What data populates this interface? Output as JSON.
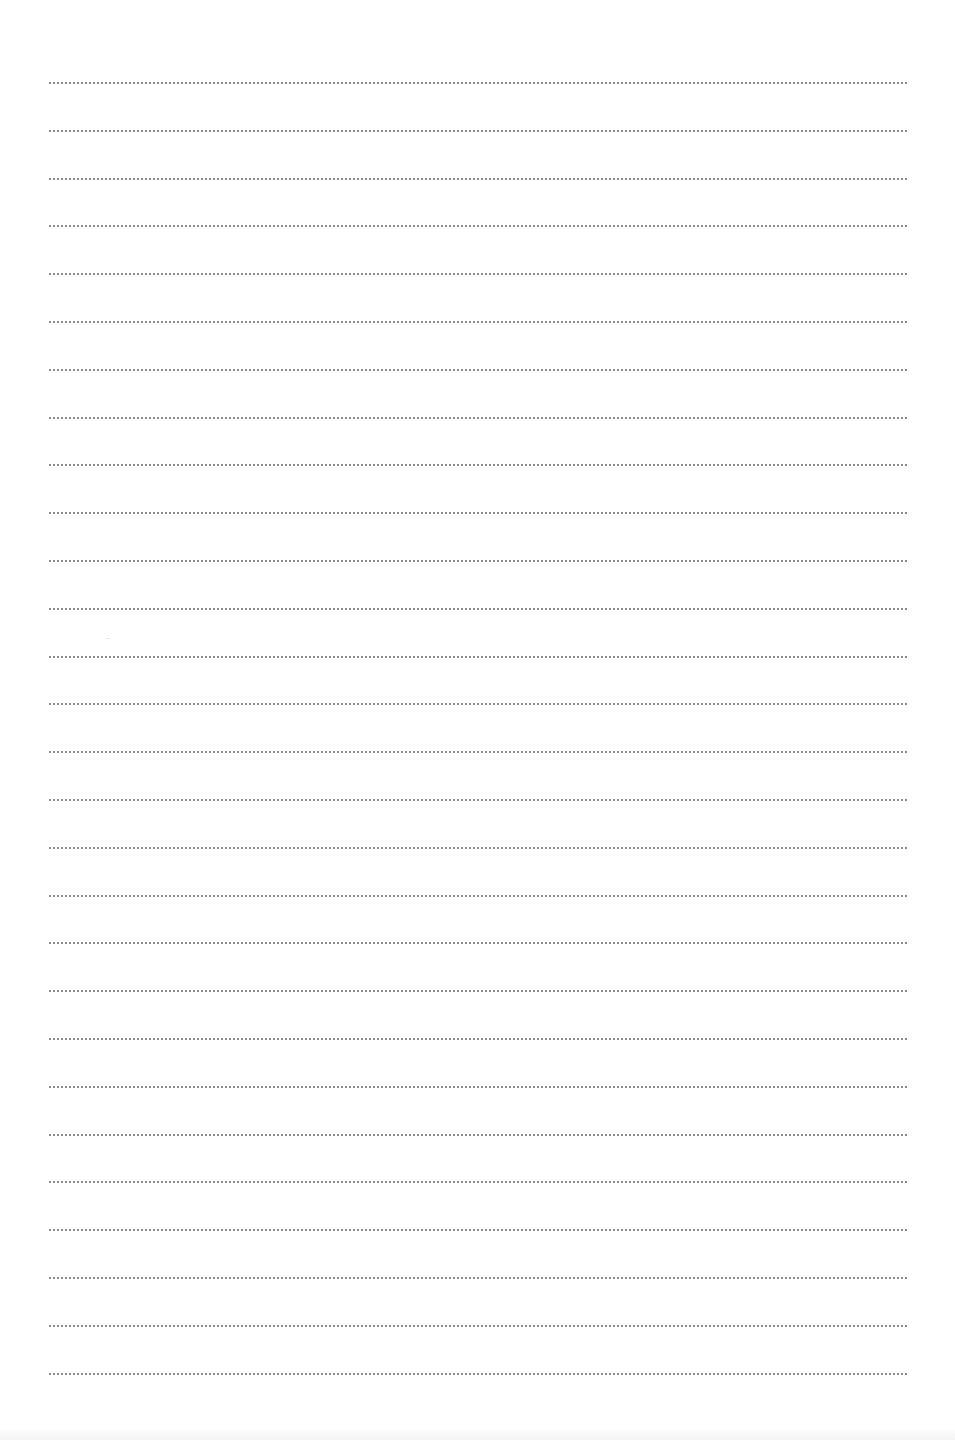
{
  "page": {
    "type": "ruled-notebook-page",
    "background_color": "#ffffff",
    "line_style": "dotted",
    "line_color": "#8a8a8a",
    "line_count": 28,
    "line_left": 48,
    "line_right": 908,
    "first_line_y": 83,
    "line_spacing": 47.8,
    "text_content": ""
  }
}
